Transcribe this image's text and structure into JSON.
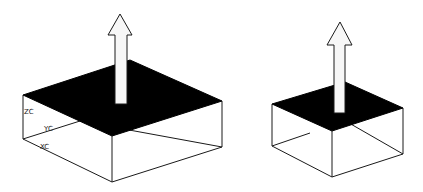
{
  "figure": {
    "colors": {
      "background": "#ffffff",
      "top_face": "#000000",
      "edges": "#1a1a1a",
      "arrow_fill": "#f7f7f7"
    },
    "left_box": {
      "axis_labels": {
        "z": "ZC",
        "y": "YC",
        "x": "XC"
      }
    },
    "right_box": {}
  }
}
